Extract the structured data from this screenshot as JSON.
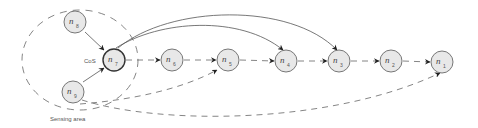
{
  "diagram": {
    "region": {
      "label": "Sensing area",
      "inner_label": "CoS"
    },
    "nodes": [
      {
        "id": "n8",
        "base": "n",
        "sub": "8",
        "x": 75,
        "y": 22,
        "hub": false
      },
      {
        "id": "n7",
        "base": "n",
        "sub": "7",
        "x": 114,
        "y": 60,
        "hub": true
      },
      {
        "id": "n9",
        "base": "n",
        "sub": "9",
        "x": 73,
        "y": 92,
        "hub": false
      },
      {
        "id": "n6",
        "base": "n",
        "sub": "6",
        "x": 172,
        "y": 60,
        "hub": false
      },
      {
        "id": "n5",
        "base": "n",
        "sub": "5",
        "x": 228,
        "y": 60,
        "hub": false
      },
      {
        "id": "n4",
        "base": "n",
        "sub": "4",
        "x": 286,
        "y": 61,
        "hub": false
      },
      {
        "id": "n3",
        "base": "n",
        "sub": "3",
        "x": 339,
        "y": 61,
        "hub": false
      },
      {
        "id": "n2",
        "base": "n",
        "sub": "2",
        "x": 391,
        "y": 61,
        "hub": false
      },
      {
        "id": "n1",
        "base": "n",
        "sub": "1",
        "x": 442,
        "y": 62,
        "hub": false
      }
    ],
    "edges": [
      {
        "from": "n8",
        "to": "n7",
        "style": "solid"
      },
      {
        "from": "n9",
        "to": "n7",
        "style": "solid"
      },
      {
        "from": "n7",
        "to": "n6",
        "style": "dashed"
      },
      {
        "from": "n6",
        "to": "n5",
        "style": "dashed"
      },
      {
        "from": "n5",
        "to": "n4",
        "style": "dashed"
      },
      {
        "from": "n4",
        "to": "n3",
        "style": "dashed"
      },
      {
        "from": "n3",
        "to": "n2",
        "style": "dashed"
      },
      {
        "from": "n2",
        "to": "n1",
        "style": "dashed"
      },
      {
        "from": "n7",
        "to": "n4",
        "style": "solid-arc"
      },
      {
        "from": "n7",
        "to": "n3",
        "style": "solid-arc"
      },
      {
        "from": "n9",
        "to": "n5",
        "style": "dashed-arc"
      },
      {
        "from": "n9",
        "to": "n1",
        "style": "dashed-arc"
      }
    ]
  }
}
